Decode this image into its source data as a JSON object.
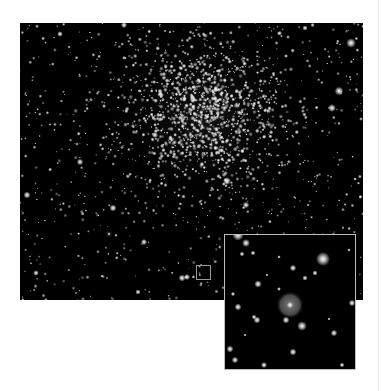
{
  "figure": {
    "colors": {
      "background": "#ffffff",
      "sky": "#000000",
      "inset_border": "#bdbdbd",
      "marker_border": "#9a9a9a",
      "nebula": "#8a8a8a"
    }
  },
  "main_image": {
    "width": 343,
    "height": 277,
    "cluster_center": [
      185,
      92
    ],
    "cluster_radius": 85,
    "field_star_count": 900,
    "cluster_star_count": 1100,
    "seed": 7,
    "bright_stars": [
      [
        331,
        20,
        2.2
      ],
      [
        319,
        68,
        2.0
      ],
      [
        312,
        85,
        1.8
      ],
      [
        7,
        172,
        1.6
      ],
      [
        93,
        185,
        1.6
      ],
      [
        124,
        219,
        1.4
      ],
      [
        207,
        158,
        1.8
      ],
      [
        226,
        182,
        1.5
      ],
      [
        162,
        255,
        1.6
      ],
      [
        167,
        254,
        1.4
      ],
      [
        104,
        2,
        1.4
      ],
      [
        40,
        11,
        1.3
      ],
      [
        285,
        5,
        1.2
      ],
      [
        60,
        139,
        1.5
      ],
      [
        135,
        112,
        1.4
      ],
      [
        250,
        243,
        1.3
      ],
      [
        118,
        269,
        1.2
      ],
      [
        16,
        250,
        1.3
      ]
    ],
    "fuzzy_object": [
      89,
      211,
      4
    ],
    "marker_box": {
      "x": 176,
      "y": 242,
      "size": 15
    }
  },
  "inset": {
    "width": 132,
    "height": 136,
    "nebula": {
      "x": 65,
      "y": 70,
      "r": 14
    },
    "stars": [
      [
        13,
        0,
        2.6
      ],
      [
        21,
        8,
        1.8
      ],
      [
        17,
        19,
        1.1
      ],
      [
        28,
        18,
        1.1
      ],
      [
        98,
        24,
        3.2
      ],
      [
        68,
        33,
        1.5
      ],
      [
        80,
        43,
        1.2
      ],
      [
        90,
        38,
        1.2
      ],
      [
        33,
        49,
        1.7
      ],
      [
        54,
        54,
        0.9
      ],
      [
        8,
        59,
        1.0
      ],
      [
        13,
        72,
        1.6
      ],
      [
        65,
        70,
        1.4
      ],
      [
        127,
        68,
        1.5
      ],
      [
        32,
        85,
        1.6
      ],
      [
        29,
        82,
        1.1
      ],
      [
        61,
        85,
        1.6
      ],
      [
        77,
        91,
        2.2
      ],
      [
        109,
        98,
        1.5
      ],
      [
        5,
        114,
        1.6
      ],
      [
        68,
        117,
        1.6
      ],
      [
        10,
        125,
        1.5
      ],
      [
        39,
        130,
        1.4
      ],
      [
        117,
        130,
        1.1
      ],
      [
        42,
        40,
        0.7
      ],
      [
        124,
        15,
        0.8
      ],
      [
        104,
        84,
        0.7
      ],
      [
        54,
        22,
        0.8
      ],
      [
        20,
        100,
        0.7
      ]
    ]
  }
}
